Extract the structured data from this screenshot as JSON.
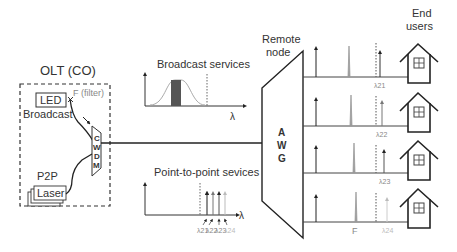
{
  "olt": {
    "title": "OLT (CO)",
    "led_label": "LED",
    "filter_label": "F (filter)",
    "broadcast_label": "Broadcast",
    "cwdm_letters": [
      "C",
      "W",
      "D",
      "M"
    ],
    "p2p_label": "P2P",
    "laser_label": "Laser"
  },
  "broadcast_services": {
    "title": "Broadcast services",
    "axis_label": "λ"
  },
  "p2p_services": {
    "title": "Point-to-point sevices",
    "axis_label": "λ",
    "wavelengths": [
      "λ21",
      "λ22",
      "λ23",
      "λ24"
    ]
  },
  "remote_node": {
    "title_line1": "Remote",
    "title_line2": "node",
    "awg_letters": [
      "A",
      "W",
      "G"
    ]
  },
  "end_users": {
    "title_line1": "End",
    "title_line2": "users"
  },
  "channels": [
    {
      "wavelength": "λ21"
    },
    {
      "wavelength": "λ22"
    },
    {
      "wavelength": "λ23"
    },
    {
      "wavelength": "λ24",
      "filter_label": "F"
    }
  ],
  "colors": {
    "line": "#222222",
    "broadcast_fill": "#555555",
    "curve": "#aaaaaa"
  }
}
